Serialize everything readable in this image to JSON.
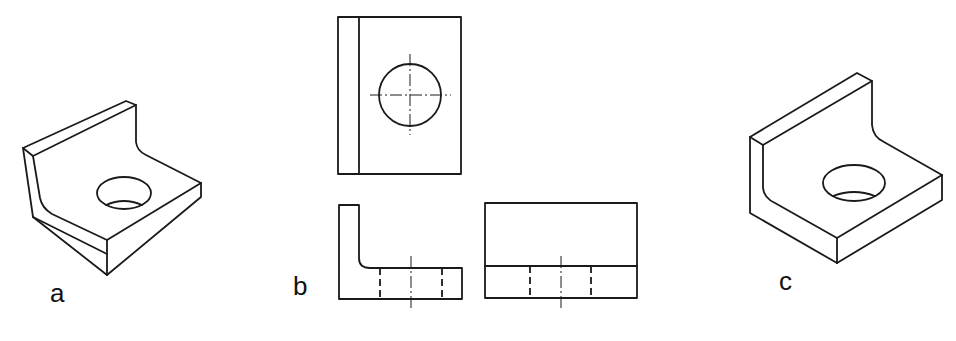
{
  "figure": {
    "type": "technical drawing",
    "panels": [
      {
        "id": "a",
        "label": "a",
        "view": "isometric view (rotated)"
      },
      {
        "id": "b",
        "label": "b",
        "view": "orthographic projection: top view, front view, side view"
      },
      {
        "id": "c",
        "label": "c",
        "view": "isometric view"
      }
    ]
  },
  "colors": {
    "line": "#1a1a1a",
    "background": "#ffffff"
  }
}
